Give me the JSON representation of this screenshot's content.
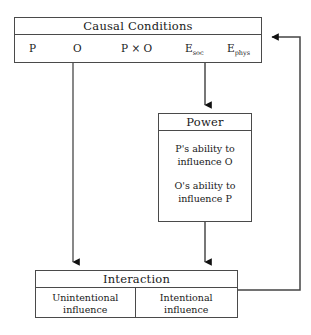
{
  "diagram": {
    "stroke_color": "#4a4a4a",
    "background_color": "#ffffff",
    "text_color": "#1a1a1a"
  },
  "causal_conditions": {
    "title": "Causal Conditions",
    "terms": {
      "person": "P",
      "other": "O",
      "interaction_product": "P × O",
      "environment_social_base": "E",
      "environment_social_sub": "soc",
      "environment_physical_base": "E",
      "environment_physical_sub": "phys"
    }
  },
  "power": {
    "title": "Power",
    "lines": [
      "P's ability to influence O",
      "O's ability to influence P"
    ],
    "line_1_part_1": "P's ability to",
    "line_1_part_2": "influence O",
    "line_2_part_1": "O's ability to",
    "line_2_part_2": "influence P"
  },
  "interaction": {
    "title": "Interaction",
    "cells": [
      {
        "line_1": "Unintentional",
        "line_2": "influence"
      },
      {
        "line_1": "Intentional",
        "line_2": "influence"
      }
    ]
  },
  "connectors": [
    {
      "name": "p-to-pxo-curve",
      "from": "P",
      "to": "P × O",
      "style": "curved-arrow"
    },
    {
      "name": "o-to-pxo",
      "from": "O",
      "to": "P × O",
      "style": "straight-arrow"
    },
    {
      "name": "esoc-to-pxo",
      "from": "E soc",
      "to": "P × O",
      "style": "straight-arrow-left"
    },
    {
      "name": "causal-to-interaction",
      "from": "Causal Conditions",
      "to": "Interaction",
      "style": "vertical-arrow"
    },
    {
      "name": "causal-to-power",
      "from": "Causal Conditions",
      "to": "Power",
      "style": "vertical-arrow"
    },
    {
      "name": "power-to-interaction",
      "from": "Power",
      "to": "Interaction",
      "style": "vertical-arrow"
    },
    {
      "name": "interaction-feedback-to-causal",
      "from": "Interaction",
      "to": "Causal Conditions",
      "style": "feedback-loop"
    }
  ]
}
